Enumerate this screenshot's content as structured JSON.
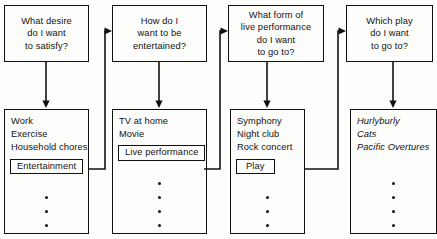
{
  "figure": {
    "type": "decision-flowchart",
    "orientation": "left-to-right",
    "stages": 4,
    "background_color": "#fdfdfc",
    "line_color": "#111111"
  },
  "columns": [
    {
      "id": "col-1",
      "question": {
        "lines": [
          "What desire",
          "do I want",
          "to satisfy?"
        ]
      },
      "options": [
        {
          "label": "Work",
          "selected": false
        },
        {
          "label": "Exercise",
          "selected": false
        },
        {
          "label": "Household chores",
          "selected": false
        },
        {
          "label": "Entertainment",
          "selected": true
        }
      ],
      "ellipsis_dots": 3,
      "italic": false
    },
    {
      "id": "col-2",
      "question": {
        "lines": [
          "How do I",
          "want to be",
          "entertained?"
        ]
      },
      "options": [
        {
          "label": "TV at home",
          "selected": false
        },
        {
          "label": "Movie",
          "selected": false
        },
        {
          "label": "Live performance",
          "selected": true
        }
      ],
      "ellipsis_dots": 4,
      "italic": false
    },
    {
      "id": "col-3",
      "question": {
        "lines": [
          "What form of",
          "live performance",
          "do I want",
          "to go to?"
        ]
      },
      "options": [
        {
          "label": "Symphony",
          "selected": false
        },
        {
          "label": "Night club",
          "selected": false
        },
        {
          "label": "Rock concert",
          "selected": false
        },
        {
          "label": "Play",
          "selected": true
        }
      ],
      "ellipsis_dots": 3,
      "italic": false
    },
    {
      "id": "col-4",
      "question": {
        "lines": [
          "Which play",
          "do I want",
          "to go to?"
        ]
      },
      "options": [
        {
          "label": "Hurlyburly",
          "selected": false
        },
        {
          "label": "Cats",
          "selected": false
        },
        {
          "label": "Pacific Overtures",
          "selected": false
        }
      ],
      "ellipsis_dots": 4,
      "italic": true
    }
  ],
  "connectors": [
    {
      "id": "c1",
      "kind": "down-arrow",
      "from": "col-1-question",
      "to": "col-1-options"
    },
    {
      "id": "c2",
      "kind": "down-arrow",
      "from": "col-2-question",
      "to": "col-2-options"
    },
    {
      "id": "c3",
      "kind": "down-arrow",
      "from": "col-3-question",
      "to": "col-3-options"
    },
    {
      "id": "c4",
      "kind": "down-arrow",
      "from": "col-4-question",
      "to": "col-4-options"
    },
    {
      "id": "c5",
      "kind": "elbow-arrow",
      "from": "col-1-selected",
      "to": "col-2-question-left"
    },
    {
      "id": "c6",
      "kind": "elbow-arrow",
      "from": "col-2-selected",
      "to": "col-3-question-left"
    },
    {
      "id": "c7",
      "kind": "elbow-arrow",
      "from": "col-3-selected",
      "to": "col-4-question-left"
    }
  ]
}
